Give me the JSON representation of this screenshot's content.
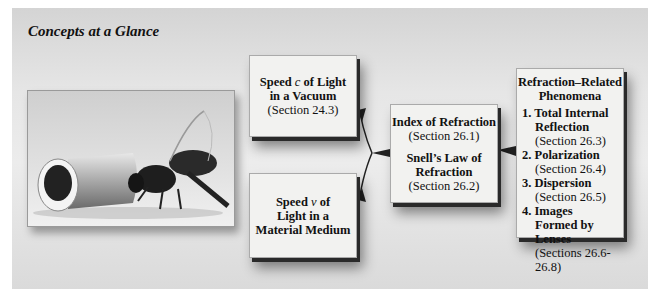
{
  "title": "Concepts at a Glance",
  "photo": {
    "description": "bee-and-glass-rod-photo"
  },
  "boxes": {
    "speed_vacuum": {
      "line1": "Speed ",
      "var": "c",
      "line1b": " of Light",
      "line2": "in a Vacuum",
      "section": "(Section 24.3)"
    },
    "speed_medium": {
      "line1": "Speed ",
      "var": "v",
      "line1b": " of",
      "line2": "Light in a",
      "line3": "Material Medium"
    },
    "index": {
      "heading1": "Index of Refraction",
      "section1": "(Section 26.1)",
      "heading2a": "Snell’s Law of",
      "heading2b": "Refraction",
      "section2": "(Section 26.2)"
    },
    "phenomena": {
      "heading1": "Refraction–Related",
      "heading2": "Phenomena",
      "items": [
        {
          "label": "1. Total Internal Reflection",
          "section": "(Section 26.3)"
        },
        {
          "label": "2. Polarization",
          "section": "(Section 26.4)"
        },
        {
          "label": "3. Dispersion",
          "section": "(Section 26.5)"
        },
        {
          "label": "4. Images Formed by Lenses",
          "section": "(Sections 26.6-26.8)"
        }
      ]
    }
  },
  "colors": {
    "panel": "#e6e6e6",
    "box": "#f2f2f0",
    "shadow": "#2a2a2a",
    "text": "#111111"
  }
}
